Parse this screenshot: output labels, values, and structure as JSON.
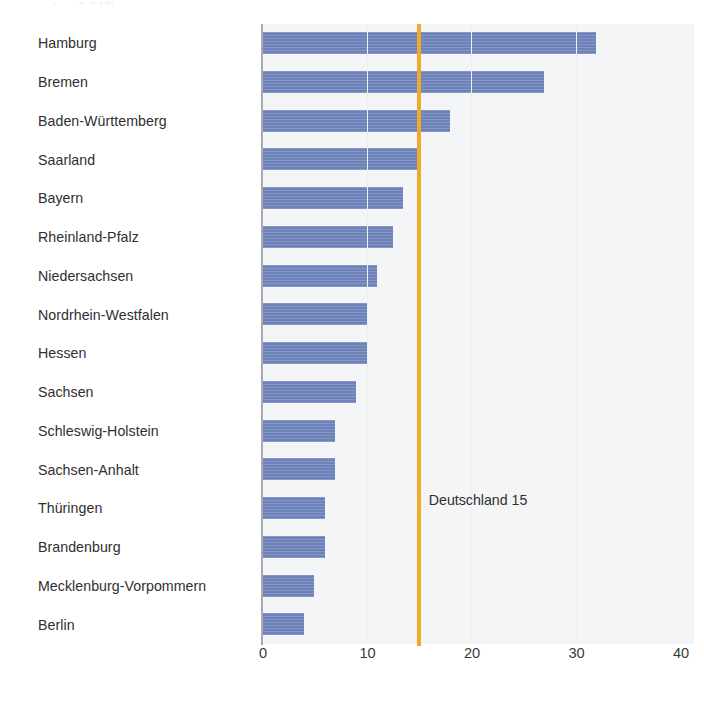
{
  "top_cut_text": "(n = 1.240)",
  "chart_data": {
    "type": "bar",
    "orientation": "horizontal",
    "title": "",
    "subtitle": "",
    "xlabel": "",
    "ylabel": "",
    "xlim": [
      0,
      40
    ],
    "xticks": [
      0,
      10,
      20,
      30,
      40
    ],
    "xtick_labels": [
      "0",
      "10",
      "20",
      "30",
      "40"
    ],
    "grid": "vertical-faint",
    "legend": "none",
    "bar_color": "#6e82ba",
    "plot_background": "#f4f5f7",
    "axis_color": "#a9aab0",
    "categories": [
      "Hamburg",
      "Bremen",
      "Baden-Württemberg",
      "Saarland",
      "Bayern",
      "Rheinland-Pfalz",
      "Niedersachsen",
      "Nordrhein-Westfalen",
      "Hessen",
      "Sachsen",
      "Schleswig-Holstein",
      "Sachsen-Anhalt",
      "Thüringen",
      "Brandenburg",
      "Mecklenburg-Vorpommern",
      "Berlin"
    ],
    "values": [
      32,
      27,
      18,
      15,
      13.5,
      12.5,
      11,
      10,
      10,
      9,
      7,
      7,
      6,
      6,
      5,
      4
    ],
    "reference_line": {
      "label": "Deutschland 15",
      "value": 15,
      "color": "#f0a92c",
      "label_row_index": 12
    }
  }
}
